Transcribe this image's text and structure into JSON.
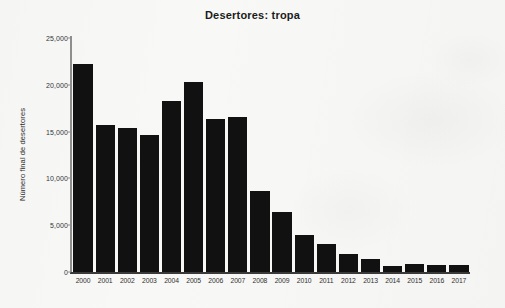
{
  "chart_data": {
    "type": "bar",
    "title": "Desertores: tropa",
    "xlabel": "",
    "ylabel": "Número final de desertores",
    "categories": [
      "2000",
      "2001",
      "2002",
      "2003",
      "2004",
      "2005",
      "2006",
      "2007",
      "2008",
      "2009",
      "2010",
      "2011",
      "2012",
      "2013",
      "2014",
      "2015",
      "2016",
      "2017"
    ],
    "values": [
      22250,
      15700,
      15350,
      14600,
      18300,
      20250,
      16350,
      16550,
      8650,
      6400,
      3950,
      3000,
      1950,
      1400,
      600,
      850,
      750,
      750
    ],
    "ylim": [
      0,
      25000
    ],
    "ytick_values": [
      0,
      5000,
      10000,
      15000,
      20000,
      25000
    ],
    "ytick_labels": [
      "0",
      "5,000",
      "10,000",
      "15,000",
      "20,000",
      "25,000"
    ],
    "grid": false,
    "legend": null,
    "bar_color": "#111111",
    "background_color": "#f8f8f6"
  }
}
